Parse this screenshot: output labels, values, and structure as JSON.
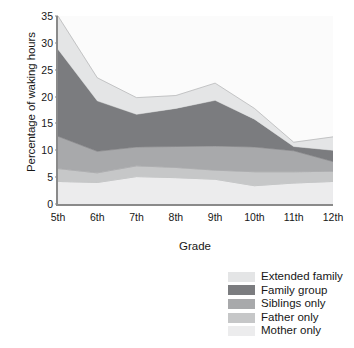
{
  "chart_data": {
    "type": "area",
    "stacked": true,
    "title": "",
    "xlabel": "Grade",
    "ylabel": "Percentage of waking hours",
    "categories": [
      "5th",
      "6th",
      "7th",
      "8th",
      "9th",
      "10th",
      "11th",
      "12th"
    ],
    "x": [
      "5th",
      "6th",
      "7th",
      "8th",
      "9th",
      "10th",
      "11th",
      "12th"
    ],
    "ylim": [
      0,
      35
    ],
    "yticks": [
      0,
      5,
      10,
      15,
      20,
      25,
      30,
      35
    ],
    "grid": false,
    "legend_position": "below-right",
    "stack_order_bottom_to_top": [
      "Mother only",
      "Father only",
      "Siblings only",
      "Family group",
      "Extended family"
    ],
    "series": [
      {
        "name": "Mother only",
        "color": "#ececed",
        "values": [
          4.2,
          4.0,
          5.1,
          4.9,
          4.6,
          3.4,
          3.9,
          4.2
        ]
      },
      {
        "name": "Father only",
        "color": "#c6c7c8",
        "values": [
          2.4,
          1.8,
          2.0,
          1.9,
          1.7,
          2.6,
          2.1,
          1.9
        ]
      },
      {
        "name": "Siblings only",
        "color": "#a8a9ab",
        "values": [
          6.0,
          4.0,
          3.5,
          3.9,
          4.5,
          4.6,
          3.9,
          1.8
        ]
      },
      {
        "name": "Family group",
        "color": "#7b7c7f",
        "values": [
          16.2,
          9.4,
          6.1,
          7.1,
          8.5,
          5.2,
          0.8,
          2.1
        ]
      },
      {
        "name": "Extended family",
        "color": "#e4e5e6",
        "values": [
          6.2,
          4.3,
          3.1,
          2.4,
          3.2,
          2.0,
          0.8,
          2.5
        ]
      }
    ],
    "stacked_totals": [
      35.0,
      23.5,
      19.8,
      20.2,
      22.5,
      17.8,
      11.5,
      12.5
    ],
    "legend_entries": [
      {
        "label": "Extended family",
        "color": "#e4e5e6"
      },
      {
        "label": "Family group",
        "color": "#7b7c7f"
      },
      {
        "label": "Siblings only",
        "color": "#a8a9ab"
      },
      {
        "label": "Father only",
        "color": "#c6c7c8"
      },
      {
        "label": "Mother only",
        "color": "#ececed"
      }
    ],
    "colors": {
      "axis": "#8a8a8a",
      "plot_background": "#fbfbfb",
      "text": "#171717"
    }
  }
}
